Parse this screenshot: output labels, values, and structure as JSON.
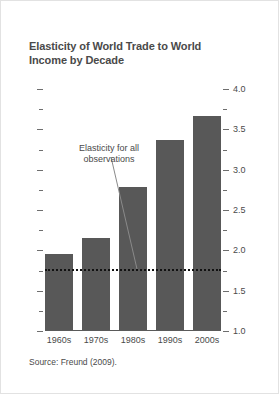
{
  "figure": {
    "title": "Elasticity of World Trade to World Income by Decade",
    "source": "Source: Freund (2009)."
  },
  "annotation": {
    "line1": "Elasticity for all",
    "line2": "observations"
  },
  "colors": {
    "bar": "#585858",
    "text": "#4a4a4a",
    "axis": "#5a5a5a",
    "refline": "#111111",
    "background": "#ffffff"
  },
  "chart_data": {
    "type": "bar",
    "title": "Elasticity of World Trade to World Income by Decade",
    "xlabel": "",
    "ylabel": "",
    "categories": [
      "1960s",
      "1970s",
      "1980s",
      "1990s",
      "2000s"
    ],
    "values": [
      1.96,
      2.15,
      2.78,
      3.37,
      3.67
    ],
    "ylim": [
      1.0,
      4.0
    ],
    "y_axis_position": "right",
    "major_ticks": [
      "1.0",
      "1.5",
      "2.0",
      "2.5",
      "3.0",
      "3.5",
      "4.0"
    ],
    "major_tick_values": [
      1.0,
      1.5,
      2.0,
      2.5,
      3.0,
      3.5,
      4.0
    ],
    "minor_tick_values": [
      1.25,
      1.75,
      2.25,
      2.75,
      3.25,
      3.75
    ],
    "grid": false,
    "legend": "none",
    "reference_line": {
      "value": 1.77,
      "style": "dotted",
      "label": "Elasticity for all observations"
    },
    "source": "Source: Freund (2009)."
  }
}
